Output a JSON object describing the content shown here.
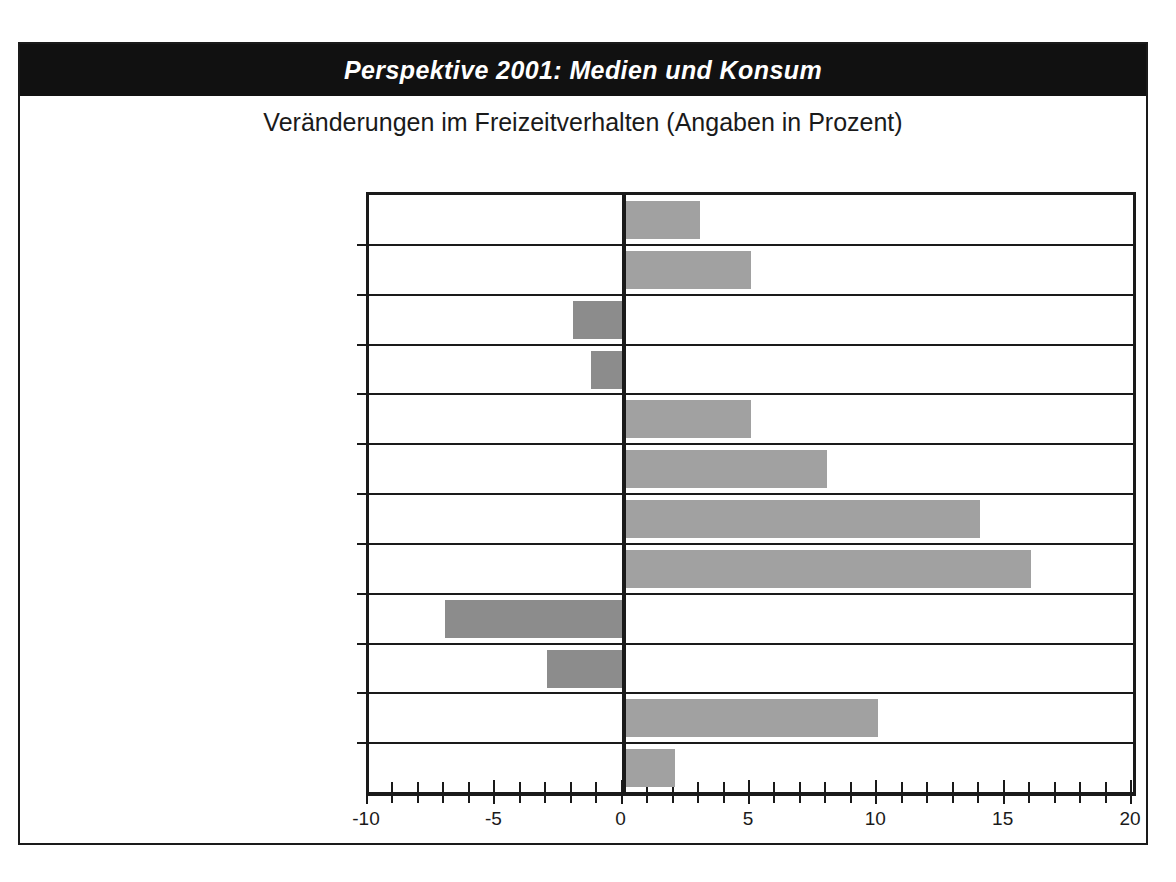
{
  "header": {
    "title": "Perspektive 2001: Medien und Konsum"
  },
  "subtitle": "Veränderungen im Freizeitverhalten (Angaben in Prozent)",
  "colors": {
    "header_background": "#111111",
    "header_text": "#ffffff",
    "bar_positive": "#a1a1a1",
    "bar_negative": "#8c8c8c",
    "axis": "#1a1a1a",
    "page_background": "#ffffff"
  },
  "chart_data": {
    "type": "bar",
    "orientation": "horizontal",
    "title": "Perspektive 2001: Medien und Konsum",
    "subtitle": "Veränderungen im Freizeitverhalten (Angaben in Prozent)",
    "xlabel": "",
    "ylabel": "",
    "xlim": [
      -10,
      20
    ],
    "xticks": [
      -10,
      -5,
      0,
      5,
      10,
      15,
      20
    ],
    "xtick_labels": [
      "-10",
      "-5",
      "0",
      "5",
      "10",
      "15",
      "20"
    ],
    "minor_tick_step": 1,
    "grid": false,
    "legend": null,
    "categories": [
      "Freizeitparks besuchen",
      "ins Kino gehen",
      "Tanzen, in die Disco gehen",
      "Sportveranstaltungen zusehen",
      "ein Volksfest, eine Kirmes besuchen",
      "in die Kneipe gehen",
      "Essengehen",
      "einen Einkaufsbummel machen",
      "ein Buch lesen",
      "eine Zeitung/Illustrierte lesen",
      "Radiohören",
      "Fernsehen"
    ],
    "values": [
      3,
      5,
      -2,
      -1.3,
      5,
      8,
      14,
      16,
      -7,
      -3,
      10,
      2
    ]
  }
}
